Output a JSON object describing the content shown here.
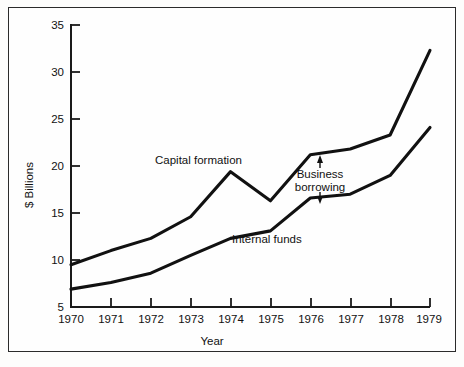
{
  "chart_data": {
    "type": "line",
    "title": "",
    "xlabel": "Year",
    "ylabel": "$ Billions",
    "categories": [
      "1970",
      "1971",
      "1972",
      "1973",
      "1974",
      "1975",
      "1976",
      "1977",
      "1978",
      "1979"
    ],
    "x": [
      1970,
      1971,
      1972,
      1973,
      1974,
      1975,
      1976,
      1977,
      1978,
      1979
    ],
    "xlim": [
      1970,
      1979
    ],
    "ylim": [
      5,
      35
    ],
    "yticks": [
      5,
      10,
      15,
      20,
      25,
      30,
      35
    ],
    "xticks": [
      "1970",
      "1971",
      "1972",
      "1973",
      "1974",
      "1975",
      "1976",
      "1977",
      "1978",
      "1979"
    ],
    "grid": false,
    "legend_position": "inline-labels",
    "series": [
      {
        "name": "Capital formation",
        "values": [
          9.5,
          11.0,
          12.3,
          14.6,
          19.4,
          16.3,
          21.2,
          21.8,
          23.3,
          32.3
        ]
      },
      {
        "name": "Internal funds",
        "values": [
          6.9,
          7.6,
          8.6,
          10.5,
          12.3,
          13.1,
          16.6,
          17.0,
          19.0,
          24.1
        ]
      }
    ],
    "annotations": [
      {
        "text": "Business borrowing",
        "lines": [
          "Business",
          "borrowing"
        ],
        "kind": "double-arrow-gap",
        "at_year": 1976.6,
        "between": [
          "Capital formation",
          "Internal funds"
        ]
      },
      {
        "text": "Capital formation",
        "kind": "series-label",
        "series": "Capital formation"
      },
      {
        "text": "Internal funds",
        "kind": "series-label",
        "series": "Internal funds"
      }
    ],
    "colors": {
      "line": "#111111",
      "axis": "#1a1a1a",
      "frame": "#2b2b2b",
      "background": "#fefefe"
    }
  },
  "axes": {
    "y_title": "$ Billions",
    "x_title": "Year",
    "y_tick_labels": [
      "35",
      "30",
      "25",
      "20",
      "15",
      "10",
      "5"
    ],
    "x_tick_labels": [
      "1970",
      "1971",
      "1972",
      "1973",
      "1974",
      "1975",
      "1976",
      "1977",
      "1978",
      "1979"
    ]
  },
  "labels": {
    "capital_formation": "Capital formation",
    "internal_funds": "Internal funds",
    "business_borrowing_line1": "Business",
    "business_borrowing_line2": "borrowing"
  }
}
